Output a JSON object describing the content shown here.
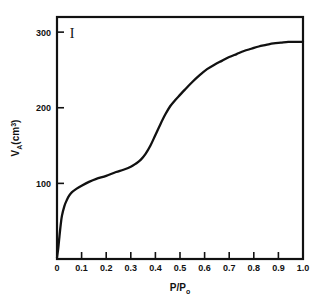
{
  "chart_data": {
    "type": "line",
    "title": "",
    "panel_label": "I",
    "xlabel": "P/Po",
    "xlabel_base": "P/P",
    "xlabel_sub": "o",
    "ylabel": "VA(cm3)",
    "ylabel_base_1": "V",
    "ylabel_sub_1": "A",
    "ylabel_base_2": "(cm",
    "ylabel_sup_2": "3",
    "ylabel_base_3": ")",
    "xlim": [
      0,
      1.0
    ],
    "ylim": [
      0,
      320
    ],
    "xticks": [
      0,
      0.1,
      0.2,
      0.3,
      0.4,
      0.5,
      0.6,
      0.7,
      0.8,
      0.9,
      1.0
    ],
    "xtick_labels": [
      "0",
      "0.1",
      "0.2",
      "0.3",
      "0.4",
      "0.5",
      "0.6",
      "0.7",
      "0.8",
      "0.9",
      "1.0"
    ],
    "yticks": [
      100,
      200,
      300
    ],
    "ytick_labels": [
      "100",
      "200",
      "300"
    ],
    "grid": false,
    "legend": "none",
    "series": [
      {
        "name": "adsorption isotherm",
        "color": "#111111",
        "x": [
          0.0,
          0.005,
          0.01,
          0.015,
          0.02,
          0.03,
          0.04,
          0.05,
          0.06,
          0.08,
          0.1,
          0.13,
          0.16,
          0.2,
          0.24,
          0.27,
          0.3,
          0.32,
          0.34,
          0.36,
          0.38,
          0.4,
          0.42,
          0.44,
          0.46,
          0.48,
          0.5,
          0.52,
          0.55,
          0.58,
          0.61,
          0.64,
          0.67,
          0.7,
          0.73,
          0.76,
          0.79,
          0.82,
          0.85,
          0.88,
          0.91,
          0.94,
          0.97,
          1.0
        ],
        "y": [
          2,
          14,
          30,
          45,
          57,
          70,
          78,
          84,
          88,
          93,
          97,
          102,
          106,
          110,
          115,
          118,
          122,
          126,
          131,
          139,
          150,
          164,
          178,
          191,
          202,
          210,
          217,
          224,
          234,
          243,
          251,
          257,
          262,
          267,
          271,
          275,
          278,
          281,
          283,
          285,
          286,
          287,
          287,
          287
        ]
      }
    ],
    "annotations": [
      {
        "text": "I",
        "x": 0.05,
        "y": 305
      }
    ],
    "geometry": {
      "plot_left": 57,
      "plot_right": 303,
      "plot_top": 17,
      "plot_bottom": 259,
      "y_value_at_top": 320,
      "y_value_at_bottom": 0
    }
  }
}
